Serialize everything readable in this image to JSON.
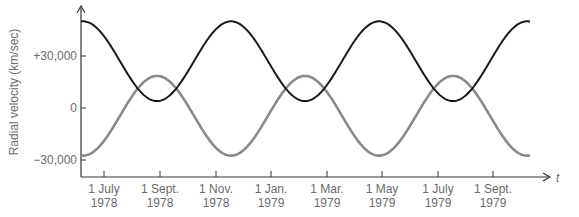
{
  "chart_data": {
    "type": "line",
    "title": "",
    "xlabel": "t",
    "ylabel": "Radial velocity (km/sec)",
    "ylim": [
      -40000,
      60000
    ],
    "y_ticks": [
      {
        "value": 30000,
        "label": "+30,000"
      },
      {
        "value": 0,
        "label": "0"
      },
      {
        "value": -30000,
        "label": "−30,000"
      }
    ],
    "x_ticks": [
      {
        "line1": "1 July",
        "line2": "1978"
      },
      {
        "line1": "1 Sept.",
        "line2": "1978"
      },
      {
        "line1": "1 Nov.",
        "line2": "1978"
      },
      {
        "line1": "1 Jan.",
        "line2": "1979"
      },
      {
        "line1": "1 Mar.",
        "line2": "1979"
      },
      {
        "line1": "1 May",
        "line2": "1979"
      },
      {
        "line1": "1 July",
        "line2": "1979"
      },
      {
        "line1": "1 Sept.",
        "line2": "1979"
      }
    ],
    "period_days": 164,
    "series": [
      {
        "name": "Receding component (dark)",
        "color": "#1a1a1a",
        "mean": 27000,
        "amplitude": 23000,
        "extremes": {
          "max": 50000,
          "min": 4000
        },
        "maxima_dates": [
          "~mid June 1978",
          "~mid Dec. 1978",
          "~early May 1979",
          "~mid Oct. 1979"
        ]
      },
      {
        "name": "Approaching component (grey)",
        "color": "#8a8a8a",
        "mean": -4500,
        "amplitude": 23000,
        "extremes": {
          "max": 18500,
          "min": -27500
        },
        "maxima_dates": [
          "~early Sept. 1978",
          "~mid Feb. 1979",
          "~late July 1979"
        ]
      }
    ],
    "grid": false,
    "legend": "none"
  }
}
